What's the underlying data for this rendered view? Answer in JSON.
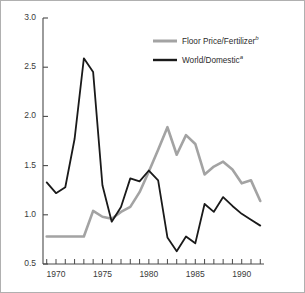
{
  "figure": {
    "background_color": "#ffffff",
    "frame_color": "#b0b0b0"
  },
  "legend": {
    "position": "top-right-inside",
    "entries": [
      {
        "label": "Floor Price/Fertilizer",
        "superscript": "b",
        "color": "#a3a3a3",
        "name": "floor-price-fertilizer"
      },
      {
        "label": "World/Domestic",
        "superscript": "a",
        "color": "#1a1a1a",
        "name": "world-domestic"
      }
    ]
  },
  "chart_data": {
    "type": "line",
    "title": "",
    "xlabel": "",
    "ylabel": "",
    "xlim": [
      1968.6,
      1992.4
    ],
    "ylim": [
      0.5,
      3.0
    ],
    "grid": false,
    "y_ticks": [
      "0.5",
      "1.0",
      "1.5",
      "2.0",
      "2.5",
      "3.0"
    ],
    "y_tick_values": [
      0.5,
      1.0,
      1.5,
      2.0,
      2.5,
      3.0
    ],
    "x_ticks_labeled": [
      "1970",
      "1975",
      "1980",
      "1985",
      "1990"
    ],
    "x_tick_label_values": [
      1970,
      1975,
      1980,
      1985,
      1990
    ],
    "x_ticks_all": [
      1969,
      1970,
      1971,
      1972,
      1973,
      1974,
      1975,
      1976,
      1977,
      1978,
      1979,
      1980,
      1981,
      1982,
      1983,
      1984,
      1985,
      1986,
      1987,
      1988,
      1989,
      1990,
      1991,
      1992
    ],
    "x": [
      1969,
      1970,
      1971,
      1972,
      1973,
      1974,
      1975,
      1976,
      1977,
      1978,
      1979,
      1980,
      1981,
      1982,
      1983,
      1984,
      1985,
      1986,
      1987,
      1988,
      1989,
      1990,
      1991,
      1992
    ],
    "series": [
      {
        "name": "Floor Price/Fertilizer",
        "superscript": "b",
        "color": "#a3a3a3",
        "line_width": 2.6,
        "values": [
          0.78,
          0.78,
          0.78,
          0.78,
          0.78,
          1.04,
          0.98,
          0.96,
          1.03,
          1.08,
          1.23,
          1.44,
          1.66,
          1.89,
          1.61,
          1.81,
          1.72,
          1.41,
          1.49,
          1.54,
          1.46,
          1.32,
          1.35,
          1.14
        ]
      },
      {
        "name": "World/Domestic",
        "superscript": "a",
        "color": "#1a1a1a",
        "line_width": 1.8,
        "values": [
          1.33,
          1.22,
          1.28,
          1.77,
          2.59,
          2.45,
          1.3,
          0.93,
          1.08,
          1.37,
          1.34,
          1.45,
          1.35,
          0.77,
          0.63,
          0.78,
          0.71,
          1.11,
          1.03,
          1.18,
          1.09,
          1.01,
          0.95,
          0.89
        ]
      }
    ]
  }
}
